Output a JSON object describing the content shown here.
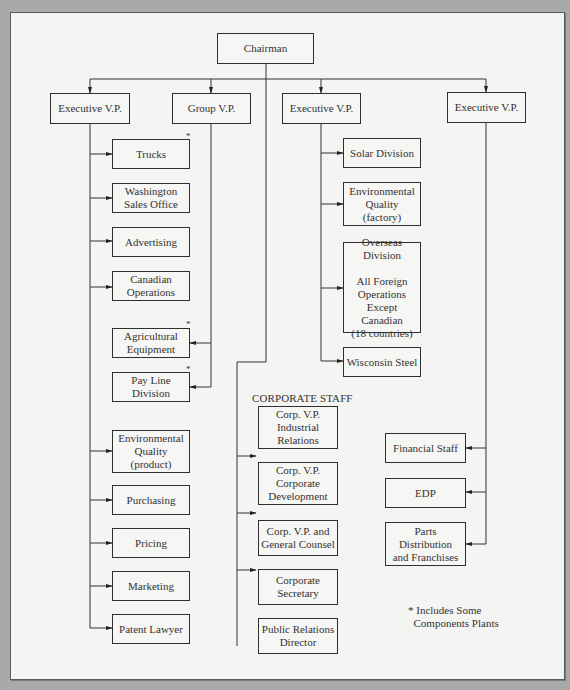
{
  "top": {
    "label": "Chairman"
  },
  "executives": [
    {
      "label": "Executive V.P."
    },
    {
      "label": "Group V.P."
    },
    {
      "label": "Executive V.P."
    },
    {
      "label": "Executive V.P."
    }
  ],
  "exec1_units": [
    {
      "label": "Trucks",
      "asterisk": "*"
    },
    {
      "label": "Washington\nSales Office"
    },
    {
      "label": "Advertising"
    },
    {
      "label": "Canadian\nOperations"
    },
    {
      "label": "Environmental\nQuality\n(product)"
    },
    {
      "label": "Purchasing"
    },
    {
      "label": "Pricing"
    },
    {
      "label": "Marketing"
    },
    {
      "label": "Patent Lawyer"
    }
  ],
  "group_units": [
    {
      "label": "Agricultural\nEquipment",
      "asterisk": "*"
    },
    {
      "label": "Pay Line\nDivision",
      "asterisk": "*"
    }
  ],
  "exec2_units": [
    {
      "label": "Solar Division"
    },
    {
      "label": "Environmental\nQuality\n(factory)"
    },
    {
      "label": "Overseas\nDivision\n\nAll Foreign\nOperations\nExcept\nCanadian\n(18 countries)"
    },
    {
      "label": "Wisconsin Steel"
    }
  ],
  "corporate_staff": {
    "heading": "CORPORATE STAFF",
    "units": [
      {
        "label": "Corp. V.P.\nIndustrial\nRelations"
      },
      {
        "label": "Corp. V.P.\nCorporate\nDevelopment"
      },
      {
        "label": "Corp. V.P. and\nGeneral Counsel"
      },
      {
        "label": "Corporate\nSecretary"
      },
      {
        "label": "Public Relations\nDirector"
      }
    ]
  },
  "exec3_units": [
    {
      "label": "Financial Staff"
    },
    {
      "label": "EDP"
    },
    {
      "label": "Parts\nDistribution\nand Franchises"
    }
  ],
  "footnote": "* Includes Some\n  Components Plants"
}
